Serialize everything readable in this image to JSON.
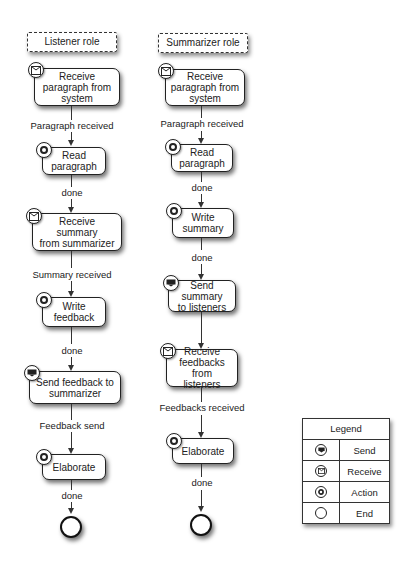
{
  "diagram": {
    "lanes": [
      {
        "role": "Listener role",
        "nodes": [
          {
            "type": "receive",
            "label": "Receive\nparagraph from\nsystem"
          },
          {
            "type": "action",
            "label": "Read\nparagraph"
          },
          {
            "type": "receive",
            "label": "Receive summary\nfrom summarizer"
          },
          {
            "type": "action",
            "label": "Write\nfeedback"
          },
          {
            "type": "send",
            "label": "Send feedback to\nsummarizer"
          },
          {
            "type": "action",
            "label": "Elaborate"
          },
          {
            "type": "end",
            "label": ""
          }
        ],
        "edges": [
          "Paragraph received",
          "done",
          "Summary received",
          "done",
          "Feedback send",
          "done"
        ]
      },
      {
        "role": "Summarizer role",
        "nodes": [
          {
            "type": "receive",
            "label": "Receive\nparagraph from\nsystem"
          },
          {
            "type": "action",
            "label": "Read\nparagraph"
          },
          {
            "type": "action",
            "label": "Write\nsummary"
          },
          {
            "type": "send",
            "label": "Send summary\nto listeners"
          },
          {
            "type": "receive",
            "label": "Receive\nfeedbacks from\nlisteners"
          },
          {
            "type": "action",
            "label": "Elaborate"
          },
          {
            "type": "end",
            "label": ""
          }
        ],
        "edges": [
          "Paragraph received",
          "done",
          "done",
          "",
          "Feedbacks received",
          "done"
        ]
      }
    ],
    "legend": {
      "title": "Legend",
      "items": [
        {
          "icon": "send-icon",
          "label": "Send"
        },
        {
          "icon": "receive-icon",
          "label": "Receive"
        },
        {
          "icon": "action-icon",
          "label": "Action"
        },
        {
          "icon": "end-icon",
          "label": "End"
        }
      ]
    }
  }
}
